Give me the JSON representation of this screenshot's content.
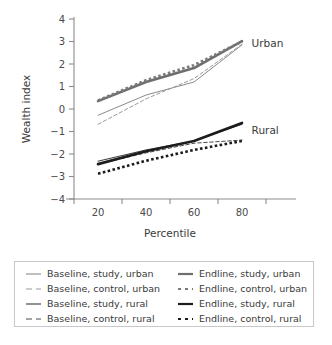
{
  "chart_data": {
    "type": "line",
    "title": "",
    "xlabel": "Percentile",
    "ylabel": "Wealth index",
    "xlim": [
      10,
      90
    ],
    "ylim": [
      -4,
      4
    ],
    "x_ticks": [
      20,
      40,
      60,
      80
    ],
    "y_ticks": [
      -4,
      -3,
      -2,
      -1,
      0,
      1,
      2,
      3,
      4
    ],
    "grid": false,
    "legend_position": "below-plot-boxed",
    "x": [
      20,
      40,
      60,
      80
    ],
    "annotations": [
      {
        "text": "Urban",
        "x": 84,
        "y": 2.95
      },
      {
        "text": "Rural",
        "x": 84,
        "y": -0.95
      }
    ],
    "series": [
      {
        "name": "Baseline, study, urban",
        "values": [
          -0.28,
          0.62,
          1.2,
          2.85
        ],
        "color": "#8a8a8a",
        "style": "solid",
        "width": 1.0,
        "group": "urban"
      },
      {
        "name": "Baseline, control, urban",
        "values": [
          -0.68,
          0.45,
          1.35,
          2.88
        ],
        "color": "#9a9a9a",
        "style": "dashed",
        "width": 1.0,
        "group": "urban"
      },
      {
        "name": "Baseline, study, rural",
        "values": [
          -2.32,
          -1.82,
          -1.42,
          -0.68
        ],
        "color": "#3a3a3a",
        "style": "solid",
        "width": 1.0,
        "group": "rural"
      },
      {
        "name": "Baseline, control, rural",
        "values": [
          -2.45,
          -1.95,
          -1.52,
          -1.38
        ],
        "color": "#4a4a4a",
        "style": "dashed",
        "width": 1.0,
        "group": "rural"
      },
      {
        "name": "Endline, study, urban",
        "values": [
          0.35,
          1.2,
          1.82,
          3.02
        ],
        "color": "#6e6e6e",
        "style": "solid",
        "width": 2.6,
        "group": "urban"
      },
      {
        "name": "Endline, control, urban",
        "values": [
          0.38,
          1.28,
          1.95,
          3.0
        ],
        "color": "#7a7a7a",
        "style": "dotted",
        "width": 2.6,
        "group": "urban"
      },
      {
        "name": "Endline, study, rural",
        "values": [
          -2.45,
          -1.88,
          -1.42,
          -0.62
        ],
        "color": "#1c1c1c",
        "style": "solid",
        "width": 2.6,
        "group": "rural"
      },
      {
        "name": "Endline, control, rural",
        "values": [
          -2.88,
          -2.3,
          -1.82,
          -1.42
        ],
        "color": "#1c1c1c",
        "style": "dotted",
        "width": 2.6,
        "group": "rural"
      }
    ]
  },
  "legend": {
    "columns": [
      [
        {
          "label": "Baseline, study, urban",
          "series_index": 0
        },
        {
          "label": "Baseline, control, urban",
          "series_index": 1
        },
        {
          "label": "Baseline, study, rural",
          "series_index": 2
        },
        {
          "label": "Baseline, control, rural",
          "series_index": 3
        }
      ],
      [
        {
          "label": "Endline, study, urban",
          "series_index": 4
        },
        {
          "label": "Endline, control, urban",
          "series_index": 5
        },
        {
          "label": "Endline, study, rural",
          "series_index": 6
        },
        {
          "label": "Endline, control, rural",
          "series_index": 7
        }
      ]
    ]
  },
  "colors": {
    "axis": "#8c8c8c",
    "text": "#3a3a3a",
    "legend_border": "#c8c8c8",
    "background": "#ffffff"
  }
}
